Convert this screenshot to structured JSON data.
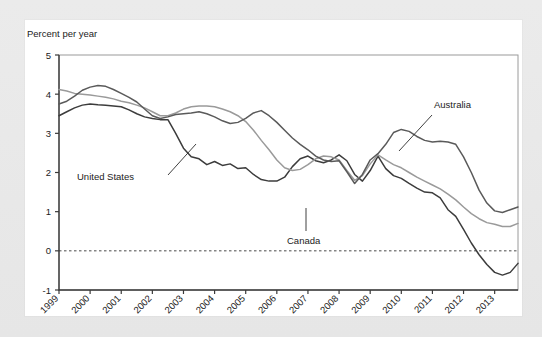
{
  "card": {
    "background": "#ffffff",
    "page_background": "#e9e9e9"
  },
  "axis": {
    "y_title": "Percent per year",
    "y_ticks": [
      "5",
      "4",
      "3",
      "2",
      "1",
      "0",
      "-1"
    ],
    "x_ticks": [
      "1999",
      "2000",
      "2001",
      "2002",
      "2003",
      "2004",
      "2005",
      "2006",
      "2007",
      "2008",
      "2009",
      "2010",
      "2011",
      "2012",
      "2013"
    ]
  },
  "annotations": [
    {
      "name": "united-states",
      "label": "United  States"
    },
    {
      "name": "canada",
      "label": "Canada"
    },
    {
      "name": "australia",
      "label": "Australia"
    }
  ],
  "chart_data": {
    "type": "line",
    "title": "",
    "subtitle": "",
    "xlabel": "",
    "ylabel": "Percent per year",
    "ylim": [
      -1,
      5
    ],
    "xlim": [
      1999,
      2013.75
    ],
    "grid": false,
    "legend": "inline-annotations",
    "zero_reference_line": 0,
    "y_ticks": [
      5,
      4,
      3,
      2,
      1,
      0,
      -1
    ],
    "x_ticks": [
      1999,
      2000,
      2001,
      2002,
      2003,
      2004,
      2005,
      2006,
      2007,
      2008,
      2009,
      2010,
      2011,
      2012,
      2013
    ],
    "x": [
      1999.0,
      1999.25,
      1999.5,
      1999.75,
      2000.0,
      2000.25,
      2000.5,
      2000.75,
      2001.0,
      2001.25,
      2001.5,
      2001.75,
      2002.0,
      2002.25,
      2002.5,
      2002.75,
      2003.0,
      2003.25,
      2003.5,
      2003.75,
      2004.0,
      2004.25,
      2004.5,
      2004.75,
      2005.0,
      2005.25,
      2005.5,
      2005.75,
      2006.0,
      2006.25,
      2006.5,
      2006.75,
      2007.0,
      2007.25,
      2007.5,
      2007.75,
      2008.0,
      2008.25,
      2008.5,
      2008.75,
      2009.0,
      2009.25,
      2009.5,
      2009.75,
      2010.0,
      2010.25,
      2010.5,
      2010.75,
      2011.0,
      2011.25,
      2011.5,
      2011.75,
      2012.0,
      2012.25,
      2012.5,
      2012.75,
      2013.0,
      2013.25,
      2013.5,
      2013.75
    ],
    "series": [
      {
        "name": "United States",
        "color": "#3c3c3c",
        "width": 1.5,
        "values": [
          3.45,
          3.55,
          3.65,
          3.72,
          3.75,
          3.73,
          3.72,
          3.7,
          3.68,
          3.6,
          3.5,
          3.42,
          3.38,
          3.35,
          3.35,
          3.0,
          2.62,
          2.4,
          2.35,
          2.2,
          2.28,
          2.18,
          2.22,
          2.1,
          2.12,
          1.95,
          1.82,
          1.78,
          1.78,
          1.88,
          2.15,
          2.35,
          2.42,
          2.3,
          2.25,
          2.32,
          2.45,
          2.3,
          1.95,
          1.78,
          2.05,
          2.42,
          2.1,
          1.92,
          1.85,
          1.72,
          1.6,
          1.5,
          1.48,
          1.35,
          1.05,
          0.88,
          0.55,
          0.2,
          -0.1,
          -0.35,
          -0.55,
          -0.62,
          -0.55,
          -0.32
        ]
      },
      {
        "name": "Canada",
        "color": "#9a9a9a",
        "width": 1.5,
        "values": [
          4.12,
          4.08,
          4.02,
          4.0,
          3.98,
          3.95,
          3.92,
          3.88,
          3.82,
          3.78,
          3.72,
          3.65,
          3.55,
          3.45,
          3.45,
          3.52,
          3.62,
          3.68,
          3.7,
          3.7,
          3.68,
          3.62,
          3.55,
          3.45,
          3.3,
          3.08,
          2.82,
          2.58,
          2.32,
          2.12,
          2.05,
          2.08,
          2.2,
          2.35,
          2.42,
          2.4,
          2.32,
          2.05,
          1.8,
          1.92,
          2.22,
          2.45,
          2.32,
          2.2,
          2.12,
          2.0,
          1.88,
          1.78,
          1.68,
          1.58,
          1.45,
          1.3,
          1.12,
          0.95,
          0.82,
          0.72,
          0.68,
          0.62,
          0.62,
          0.7
        ]
      },
      {
        "name": "Australia",
        "color": "#5a5a5a",
        "width": 1.5,
        "values": [
          3.75,
          3.82,
          3.95,
          4.1,
          4.18,
          4.22,
          4.2,
          4.12,
          4.02,
          3.92,
          3.8,
          3.62,
          3.45,
          3.38,
          3.42,
          3.48,
          3.5,
          3.52,
          3.55,
          3.5,
          3.42,
          3.32,
          3.25,
          3.28,
          3.38,
          3.52,
          3.58,
          3.45,
          3.28,
          3.08,
          2.88,
          2.72,
          2.58,
          2.42,
          2.32,
          2.28,
          2.3,
          2.02,
          1.72,
          1.95,
          2.32,
          2.48,
          2.72,
          3.02,
          3.1,
          3.05,
          2.92,
          2.82,
          2.78,
          2.8,
          2.78,
          2.72,
          2.4,
          2.0,
          1.55,
          1.22,
          1.02,
          0.98,
          1.05,
          1.12
        ]
      }
    ]
  }
}
